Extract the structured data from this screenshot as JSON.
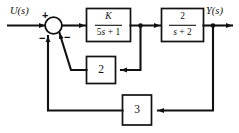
{
  "diagram": {
    "type": "control-system-block-diagram",
    "stroke_color": "#111111",
    "background_color": "#ffffff",
    "input_label": "U(s)",
    "output_label": "Y(s)",
    "summing_junction": {
      "name": "summing-junction",
      "signs": {
        "input_sign": "+",
        "inner_feedback_sign": "−",
        "outer_feedback_sign": "−"
      }
    },
    "blocks": [
      {
        "id": "forward-gain-block",
        "kind": "transfer-function",
        "numerator": "K",
        "denominator": "5s + 1",
        "expression": "K/(5s + 1)"
      },
      {
        "id": "plant-block",
        "kind": "transfer-function",
        "numerator": "2",
        "denominator": "s + 2",
        "expression": "2/(s + 2)"
      },
      {
        "id": "inner-feedback-block",
        "kind": "gain",
        "value": "2"
      },
      {
        "id": "outer-feedback-block",
        "kind": "gain",
        "value": "3"
      }
    ],
    "signals": [
      {
        "id": "input-signal",
        "label": "U(s)"
      },
      {
        "id": "output-signal",
        "label": "Y(s)"
      }
    ]
  }
}
